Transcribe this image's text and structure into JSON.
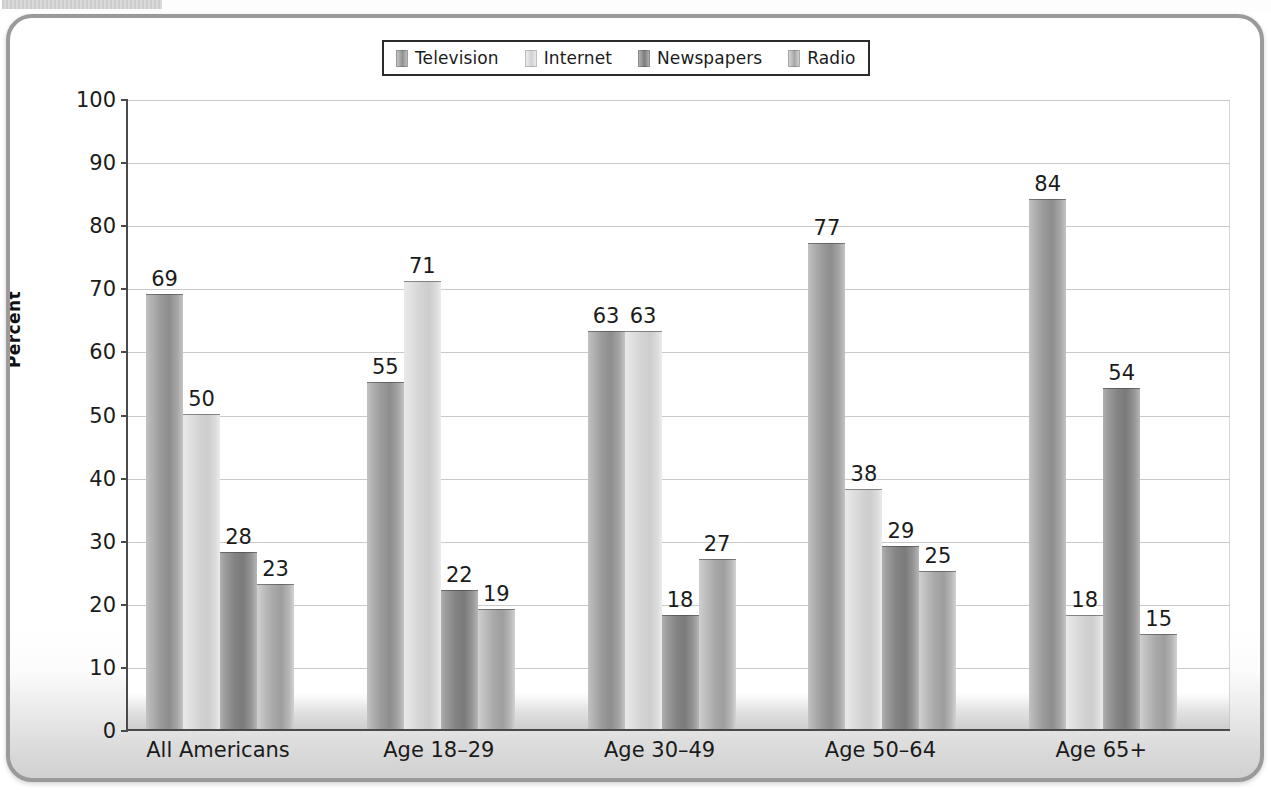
{
  "scan": {
    "top_fragment": ""
  },
  "legend": {
    "items": [
      {
        "label": "Television",
        "swatch_class": "sw0",
        "color": "#909090"
      },
      {
        "label": "Internet",
        "swatch_class": "sw1",
        "color": "#d2d2d2"
      },
      {
        "label": "Newspapers",
        "swatch_class": "sw2",
        "color": "#7d7d7d"
      },
      {
        "label": "Radio",
        "swatch_class": "sw3",
        "color": "#a6a6a6"
      }
    ]
  },
  "axes": {
    "y_title": "Percent",
    "y_ticks": [
      "0",
      "10",
      "20",
      "30",
      "40",
      "50",
      "60",
      "70",
      "80",
      "90",
      "100"
    ],
    "x_ticks": [
      "All Americans",
      "Age 18–29",
      "Age 30–49",
      "Age 50–64",
      "Age 65+"
    ]
  },
  "chart_data": {
    "type": "bar",
    "title": "",
    "xlabel": "",
    "ylabel": "Percent",
    "ylim": [
      0,
      100
    ],
    "ytick_step": 10,
    "grid": true,
    "legend_position": "top-center",
    "categories": [
      "All Americans",
      "Age 18–29",
      "Age 30–49",
      "Age 50–64",
      "Age 65+"
    ],
    "series": [
      {
        "name": "Television",
        "values": [
          69,
          55,
          63,
          77,
          84
        ]
      },
      {
        "name": "Internet",
        "values": [
          50,
          71,
          63,
          38,
          18
        ]
      },
      {
        "name": "Newspapers",
        "values": [
          28,
          22,
          18,
          29,
          54
        ]
      },
      {
        "name": "Radio",
        "values": [
          23,
          19,
          27,
          25,
          15
        ]
      }
    ],
    "value_labels": true
  }
}
